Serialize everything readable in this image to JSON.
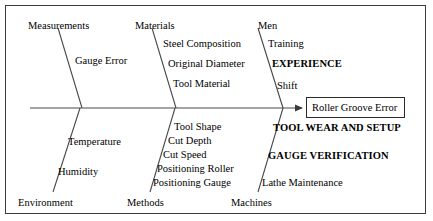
{
  "diagram": {
    "type": "fishbone-ishikawa",
    "effect": {
      "label": "Roller Groove Error"
    },
    "spine": {
      "y": 108,
      "x_start": 30,
      "x_end": 300
    },
    "categories": [
      {
        "name": "Measurements",
        "position": "top",
        "label_x": 28,
        "label_y": 20,
        "bone": {
          "x1": 58,
          "y1": 28,
          "x2": 82,
          "y2": 108
        },
        "causes": [
          {
            "label": "Gauge Error",
            "x": 75,
            "y": 55,
            "bold": false
          }
        ]
      },
      {
        "name": "Materials",
        "position": "top",
        "label_x": 135,
        "label_y": 20,
        "bone": {
          "x1": 152,
          "y1": 28,
          "x2": 176,
          "y2": 108
        },
        "causes": [
          {
            "label": "Steel Composition",
            "x": 163,
            "y": 38,
            "bold": false
          },
          {
            "label": "Original Diameter",
            "x": 168,
            "y": 58,
            "bold": false
          },
          {
            "label": "Tool Material",
            "x": 173,
            "y": 78,
            "bold": false
          }
        ]
      },
      {
        "name": "Men",
        "position": "top",
        "label_x": 258,
        "label_y": 20,
        "bone": {
          "x1": 258,
          "y1": 28,
          "x2": 283,
          "y2": 108
        },
        "causes": [
          {
            "label": "Training",
            "x": 268,
            "y": 38,
            "bold": false
          },
          {
            "label": "EXPERIENCE",
            "x": 272,
            "y": 58,
            "bold": true
          },
          {
            "label": "Shift",
            "x": 277,
            "y": 80,
            "bold": false
          }
        ]
      },
      {
        "name": "Environment",
        "position": "bottom",
        "label_x": 18,
        "label_y": 197,
        "bone": {
          "x1": 80,
          "y1": 108,
          "x2": 53,
          "y2": 192
        },
        "causes": [
          {
            "label": "Temperature",
            "x": 68,
            "y": 136,
            "bold": false
          },
          {
            "label": "Humidity",
            "x": 58,
            "y": 166,
            "bold": false
          }
        ]
      },
      {
        "name": "Methods",
        "position": "bottom",
        "label_x": 127,
        "label_y": 197,
        "bone": {
          "x1": 175,
          "y1": 108,
          "x2": 150,
          "y2": 192
        },
        "causes": [
          {
            "label": "Tool Shape",
            "x": 174,
            "y": 121,
            "bold": false
          },
          {
            "label": "Cut Depth",
            "x": 168,
            "y": 135,
            "bold": false
          },
          {
            "label": "Cut Speed",
            "x": 163,
            "y": 149,
            "bold": false
          },
          {
            "label": "Positioning Roller",
            "x": 157,
            "y": 163,
            "bold": false
          },
          {
            "label": "Positioning Gauge",
            "x": 153,
            "y": 177,
            "bold": false
          }
        ]
      },
      {
        "name": "Machines",
        "position": "bottom",
        "label_x": 231,
        "label_y": 197,
        "bone": {
          "x1": 283,
          "y1": 108,
          "x2": 258,
          "y2": 192
        },
        "causes": [
          {
            "label": "TOOL WEAR AND SETUP",
            "x": 273,
            "y": 122,
            "bold": true
          },
          {
            "label": "GAUGE VERIFICATION",
            "x": 268,
            "y": 150,
            "bold": true
          },
          {
            "label": "Lathe Maintenance",
            "x": 262,
            "y": 177,
            "bold": false
          }
        ]
      }
    ],
    "colors": {
      "line": "#4a4a4a",
      "text": "#000000",
      "border": "#3c3c3c",
      "background": "#ffffff"
    }
  }
}
